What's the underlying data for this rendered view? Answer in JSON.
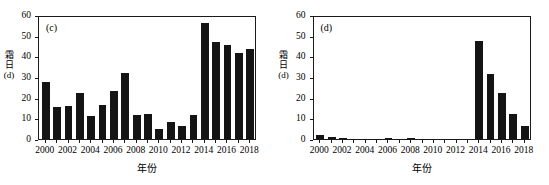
{
  "figure": {
    "panels": [
      {
        "tag": "(c)",
        "ylabel_chars": [
          "霜",
          "日"
        ],
        "ylabel_unit": "(d)",
        "xlabel": "年份"
      },
      {
        "tag": "(d)",
        "ylabel_chars": [
          "霜",
          "日"
        ],
        "ylabel_unit": "(d)",
        "xlabel": "年份"
      }
    ],
    "axis": {
      "yticks": [
        0,
        10,
        20,
        30,
        40,
        50,
        60
      ],
      "ylim": [
        0,
        60
      ],
      "xticks": [
        2000,
        2002,
        2004,
        2006,
        2008,
        2010,
        2012,
        2014,
        2016,
        2018
      ],
      "xlim": [
        1999.4,
        2018.6
      ]
    },
    "colors": {
      "bar": "#141414",
      "axis": "#1a1a1a",
      "background": "#ffffff",
      "text": "#000000"
    }
  },
  "chart_data": [
    {
      "type": "bar",
      "title": "(c)",
      "xlabel": "年份",
      "ylabel": "霜日(d)",
      "ylim": [
        0,
        60
      ],
      "grid": false,
      "legend": "none",
      "categories": [
        2000,
        2001,
        2002,
        2003,
        2004,
        2005,
        2006,
        2007,
        2008,
        2009,
        2010,
        2011,
        2012,
        2013,
        2014,
        2015,
        2016,
        2017,
        2018
      ],
      "values": [
        27.5,
        15.3,
        16.2,
        22.2,
        11.2,
        16.4,
        23.0,
        31.8,
        11.4,
        12.0,
        4.7,
        8.3,
        6.4,
        11.5,
        56.0,
        47.0,
        45.3,
        41.6,
        43.7
      ]
    },
    {
      "type": "bar",
      "title": "(d)",
      "xlabel": "年份",
      "ylabel": "霜日(d)",
      "ylim": [
        0,
        60
      ],
      "grid": false,
      "legend": "none",
      "categories": [
        2000,
        2001,
        2002,
        2003,
        2004,
        2005,
        2006,
        2007,
        2008,
        2009,
        2010,
        2011,
        2012,
        2013,
        2014,
        2015,
        2016,
        2017,
        2018
      ],
      "values": [
        1.8,
        1.0,
        0.5,
        0.1,
        0.15,
        0.1,
        0.3,
        0.15,
        0.4,
        0.05,
        0.0,
        0.0,
        0.0,
        0.0,
        47.5,
        31.5,
        22.5,
        12.2,
        6.2
      ]
    }
  ]
}
